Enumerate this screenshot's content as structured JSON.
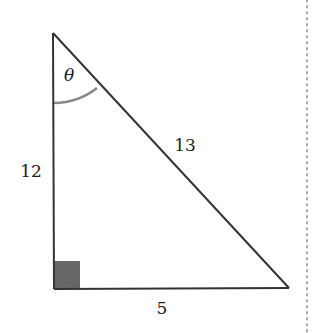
{
  "diagram": {
    "type": "right-triangle",
    "vertices": {
      "apex": [
        53,
        33
      ],
      "right_angle": [
        54,
        289
      ],
      "base_right": [
        289,
        288
      ]
    },
    "labels": {
      "angle": "θ",
      "vertical_side": "12",
      "hypotenuse": "13",
      "base": "5"
    },
    "colors": {
      "stroke": "#333333",
      "arc": "#888888",
      "right_angle_marker": "#666666",
      "dotted_rule": "#aaaaaa"
    }
  }
}
